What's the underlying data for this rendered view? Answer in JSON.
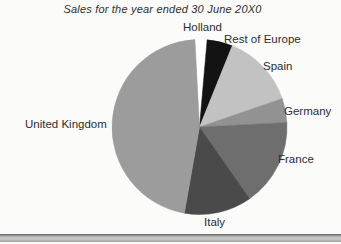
{
  "title": "Sales for the year ended 30 June 20X0",
  "background_color": "#fbfbfa",
  "text_color": "#2d2d2d",
  "bottom_rule": {
    "top_edge_color": "#636363",
    "body_color": "#c6c6c6",
    "bottom_edge_color": "#9f9f9f"
  },
  "chart_data": {
    "type": "pie",
    "title": "Sales for the year ended 30 June 20X0",
    "value_unit": "percent_of_total_sales",
    "rotation": "clockwise_from_12_oclock",
    "legend": "none",
    "labels_position": "outside",
    "center_px": {
      "x": 199.5,
      "y": 127
    },
    "radius_px": 87.5,
    "slices": [
      {
        "id": "holland",
        "label": "Holland",
        "start_deg": -3,
        "end_deg": 5,
        "percent": 2.2,
        "color": "#ffffff",
        "label_px": {
          "x": 183,
          "y": 21
        }
      },
      {
        "id": "rest-of-europe",
        "label": "Rest of Europe",
        "start_deg": 5,
        "end_deg": 22,
        "percent": 4.7,
        "color": "#131313",
        "label_px": {
          "x": 224,
          "y": 33
        }
      },
      {
        "id": "spain",
        "label": "Spain",
        "start_deg": 22,
        "end_deg": 71,
        "percent": 13.6,
        "color": "#c2c2c2",
        "label_px": {
          "x": 263,
          "y": 60
        }
      },
      {
        "id": "germany",
        "label": "Germany",
        "start_deg": 71,
        "end_deg": 87,
        "percent": 4.5,
        "color": "#929292",
        "label_px": {
          "x": 284,
          "y": 105
        }
      },
      {
        "id": "france",
        "label": "France",
        "start_deg": 87,
        "end_deg": 145,
        "percent": 16.1,
        "color": "#6e6e6e",
        "label_px": {
          "x": 278,
          "y": 153
        }
      },
      {
        "id": "italy",
        "label": "Italy",
        "start_deg": 145,
        "end_deg": 190,
        "percent": 12.5,
        "color": "#4a4a4a",
        "label_px": {
          "x": 204,
          "y": 216
        }
      },
      {
        "id": "united-kingdom",
        "label": "United Kingdom",
        "start_deg": 190,
        "end_deg": 357,
        "percent": 46.4,
        "color": "#9c9c9c",
        "label_px": {
          "x": 25,
          "y": 118
        }
      }
    ]
  }
}
